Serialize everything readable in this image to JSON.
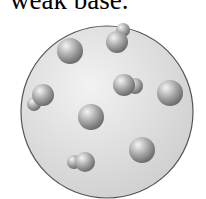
{
  "caption": "weak base.",
  "diagram": {
    "type": "particle-solution-view",
    "container": {
      "cx": 107,
      "cy": 112,
      "r": 86,
      "fill": "#e6e6e6",
      "stroke": "#555555"
    },
    "single_particles": [
      {
        "cx": 70,
        "cy": 51,
        "r": 13
      },
      {
        "cx": 170,
        "cy": 93,
        "r": 13
      },
      {
        "cx": 91,
        "cy": 117,
        "r": 13
      },
      {
        "cx": 142,
        "cy": 150,
        "r": 13
      }
    ],
    "paired_particles": [
      {
        "big": {
          "cx": 117,
          "cy": 42,
          "r": 11
        },
        "small": {
          "cx": 123,
          "cy": 30,
          "r": 7
        }
      },
      {
        "big": {
          "cx": 124,
          "cy": 85,
          "r": 11
        },
        "small": {
          "cx": 135,
          "cy": 86,
          "r": 8
        }
      },
      {
        "big": {
          "cx": 43,
          "cy": 95,
          "r": 11
        },
        "small": {
          "cx": 34,
          "cy": 104,
          "r": 7
        }
      },
      {
        "big": {
          "cx": 85,
          "cy": 162,
          "r": 10
        },
        "small": {
          "cx": 74,
          "cy": 162,
          "r": 7
        }
      }
    ]
  }
}
